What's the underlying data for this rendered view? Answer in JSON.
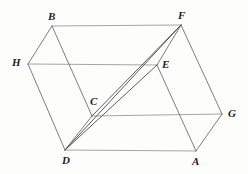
{
  "figure": {
    "kind": "geometry-diagram",
    "background_color": "#fdfdfc",
    "canvas": {
      "width": 248,
      "height": 174
    },
    "styles": {
      "horizontal_edge_color": "#9b9b9b",
      "slanted_edge_color": "#6f6f6f",
      "diagonal_color": "#4a4a4a",
      "edge_width": 0.9,
      "diagonal_width": 0.9,
      "label_color": "#1d1d1d"
    },
    "vertices": [
      {
        "name": "B",
        "x": 52,
        "y": 26,
        "label": "B",
        "label_x": 48,
        "label_y": 11
      },
      {
        "name": "F",
        "x": 181,
        "y": 25,
        "label": "F",
        "label_x": 178,
        "label_y": 10
      },
      {
        "name": "H",
        "x": 28,
        "y": 64,
        "label": "H",
        "label_x": 12,
        "label_y": 57
      },
      {
        "name": "E",
        "x": 157,
        "y": 65,
        "label": "E",
        "label_x": 162,
        "label_y": 59
      },
      {
        "name": "C",
        "x": 92,
        "y": 116,
        "label": "C",
        "label_x": 90,
        "label_y": 96
      },
      {
        "name": "G",
        "x": 222,
        "y": 114,
        "label": "G",
        "label_x": 228,
        "label_y": 108
      },
      {
        "name": "D",
        "x": 65,
        "y": 150,
        "label": "D",
        "label_x": 62,
        "label_y": 155
      },
      {
        "name": "A",
        "x": 196,
        "y": 151,
        "label": "A",
        "label_x": 192,
        "label_y": 156
      }
    ],
    "edges": [
      {
        "name": "edge-BF",
        "from": "B",
        "to": "F",
        "kind": "horizontal"
      },
      {
        "name": "edge-HE",
        "from": "H",
        "to": "E",
        "kind": "horizontal"
      },
      {
        "name": "edge-CG",
        "from": "C",
        "to": "G",
        "kind": "horizontal"
      },
      {
        "name": "edge-DA",
        "from": "D",
        "to": "A",
        "kind": "horizontal"
      },
      {
        "name": "edge-BH",
        "from": "B",
        "to": "H",
        "kind": "slanted"
      },
      {
        "name": "edge-BC",
        "from": "B",
        "to": "C",
        "kind": "slanted"
      },
      {
        "name": "edge-HD",
        "from": "H",
        "to": "D",
        "kind": "slanted"
      },
      {
        "name": "edge-CD",
        "from": "C",
        "to": "D",
        "kind": "slanted"
      },
      {
        "name": "edge-FE",
        "from": "F",
        "to": "E",
        "kind": "slanted"
      },
      {
        "name": "edge-FG",
        "from": "F",
        "to": "G",
        "kind": "slanted"
      },
      {
        "name": "edge-EA",
        "from": "E",
        "to": "A",
        "kind": "slanted"
      },
      {
        "name": "edge-AG",
        "from": "A",
        "to": "G",
        "kind": "slanted"
      }
    ],
    "diagonals": [
      {
        "name": "diagonal-DF",
        "from": "D",
        "to": "F"
      },
      {
        "name": "diagonal-CF",
        "from": "C",
        "to": "F"
      },
      {
        "name": "diagonal-DE",
        "from": "D",
        "to": "E"
      }
    ]
  }
}
